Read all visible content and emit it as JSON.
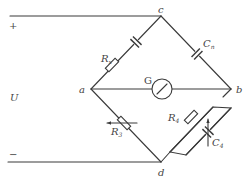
{
  "diagram": {
    "type": "Schering bridge circuit",
    "colors": {
      "line": "#3a3a3a",
      "text": "#444444",
      "background": "#ffffff"
    },
    "source": {
      "plus": "+",
      "minus": "−",
      "voltage": "U"
    },
    "nodes": {
      "a": "a",
      "b": "b",
      "c": "c",
      "d": "d"
    },
    "components": {
      "rx": {
        "main": "R",
        "sub": "x"
      },
      "cx": {
        "main": "C",
        "sub": "n"
      },
      "galvanometer": "G",
      "r3": {
        "main": "R",
        "sub": "3"
      },
      "r4": {
        "main": "R",
        "sub": "4"
      },
      "c4": {
        "main": "C",
        "sub": "4"
      }
    }
  }
}
